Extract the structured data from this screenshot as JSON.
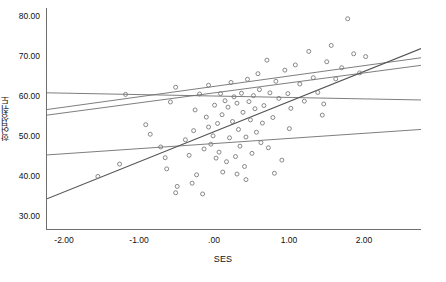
{
  "chart_data": {
    "type": "scatter",
    "title": "",
    "xlabel": "SES",
    "ylabel": "학업성취도",
    "xlim": [
      -2.6,
      2.4
    ],
    "ylim": [
      27.0,
      82.5
    ],
    "xticks": [
      -2,
      -1,
      0,
      1,
      2
    ],
    "xtick_labels": [
      "-2.00",
      "-1.00",
      ".00",
      "1.00",
      "2.00"
    ],
    "yticks": [
      30,
      40,
      50,
      60,
      70,
      80
    ],
    "ytick_labels": [
      "30.00",
      "40.00",
      "50.00",
      "60.00",
      "70.00",
      "80.00"
    ],
    "grid": false,
    "legend": "none",
    "marker": {
      "shape": "open-circle",
      "size": 4,
      "color": "#7a7a7a",
      "fill": "none"
    },
    "points": [
      [
        -1.92,
        40.2
      ],
      [
        -1.63,
        43.3
      ],
      [
        -1.55,
        60.8
      ],
      [
        -1.28,
        53.2
      ],
      [
        -1.22,
        50.8
      ],
      [
        -1.08,
        47.6
      ],
      [
        -1.02,
        44.9
      ],
      [
        -1.0,
        42.1
      ],
      [
        -0.88,
        62.6
      ],
      [
        -0.86,
        37.7
      ],
      [
        -0.88,
        36.1
      ],
      [
        -0.75,
        49.4
      ],
      [
        -0.7,
        45.5
      ],
      [
        -0.66,
        38.5
      ],
      [
        -0.62,
        56.9
      ],
      [
        -0.6,
        40.6
      ],
      [
        -0.56,
        60.9
      ],
      [
        -0.52,
        35.8
      ],
      [
        -0.5,
        47.1
      ],
      [
        -0.47,
        55.1
      ],
      [
        -0.44,
        52.6
      ],
      [
        -0.41,
        48.3
      ],
      [
        -0.38,
        50.4
      ],
      [
        -0.36,
        58.1
      ],
      [
        -0.34,
        44.8
      ],
      [
        -0.32,
        53.5
      ],
      [
        -0.3,
        46.3
      ],
      [
        -0.28,
        61.0
      ],
      [
        -0.26,
        55.7
      ],
      [
        -0.25,
        41.3
      ],
      [
        -0.22,
        59.2
      ],
      [
        -0.2,
        43.9
      ],
      [
        -0.18,
        57.6
      ],
      [
        -0.16,
        49.9
      ],
      [
        -0.14,
        63.8
      ],
      [
        -0.12,
        54.0
      ],
      [
        -0.1,
        60.2
      ],
      [
        -0.08,
        45.2
      ],
      [
        -0.06,
        58.6
      ],
      [
        -0.04,
        52.0
      ],
      [
        -0.02,
        47.8
      ],
      [
        0.0,
        61.1
      ],
      [
        0.02,
        56.3
      ],
      [
        0.04,
        42.7
      ],
      [
        0.06,
        50.1
      ],
      [
        0.08,
        64.6
      ],
      [
        0.1,
        59.0
      ],
      [
        0.12,
        54.4
      ],
      [
        0.14,
        46.0
      ],
      [
        0.16,
        60.5
      ],
      [
        0.18,
        57.2
      ],
      [
        0.2,
        51.3
      ],
      [
        0.22,
        66.0
      ],
      [
        0.24,
        62.0
      ],
      [
        0.26,
        48.7
      ],
      [
        0.3,
        58.0
      ],
      [
        0.34,
        69.4
      ],
      [
        0.38,
        61.2
      ],
      [
        0.42,
        55.0
      ],
      [
        0.46,
        64.1
      ],
      [
        0.5,
        59.8
      ],
      [
        0.54,
        44.3
      ],
      [
        0.58,
        66.9
      ],
      [
        0.62,
        61.0
      ],
      [
        0.66,
        57.3
      ],
      [
        0.72,
        68.2
      ],
      [
        0.78,
        63.4
      ],
      [
        0.84,
        59.1
      ],
      [
        0.9,
        71.6
      ],
      [
        0.96,
        65.0
      ],
      [
        1.02,
        61.3
      ],
      [
        1.08,
        55.6
      ],
      [
        1.14,
        69.0
      ],
      [
        1.2,
        73.1
      ],
      [
        1.26,
        64.7
      ],
      [
        1.34,
        67.5
      ],
      [
        1.42,
        79.8
      ],
      [
        1.5,
        71.0
      ],
      [
        1.58,
        66.2
      ],
      [
        1.66,
        70.3
      ],
      [
        0.28,
        53.6
      ],
      [
        0.36,
        47.4
      ],
      [
        -0.64,
        51.7
      ],
      [
        -0.95,
        58.9
      ],
      [
        0.64,
        52.2
      ],
      [
        1.1,
        58.4
      ],
      [
        -0.06,
        40.8
      ],
      [
        0.06,
        39.4
      ],
      [
        0.44,
        41.0
      ],
      [
        -0.44,
        63.1
      ]
    ],
    "regression_lines": [
      {
        "name": "line-1-flat-high",
        "x0": -2.6,
        "y0": 61.2,
        "x1": 2.4,
        "y1": 59.4,
        "color": "#6f6f6f",
        "width": 0.9
      },
      {
        "name": "line-2-moderate",
        "x0": -2.6,
        "y0": 57.0,
        "x1": 2.4,
        "y1": 70.0,
        "color": "#6f6f6f",
        "width": 0.9
      },
      {
        "name": "line-3-moderate-lower",
        "x0": -2.6,
        "y0": 55.6,
        "x1": 2.4,
        "y1": 68.1,
        "color": "#6f6f6f",
        "width": 0.9
      },
      {
        "name": "line-4-shallow",
        "x0": -2.6,
        "y0": 45.6,
        "x1": 2.4,
        "y1": 52.0,
        "color": "#6f6f6f",
        "width": 0.9
      },
      {
        "name": "line-5-steep",
        "x0": -2.6,
        "y0": 34.6,
        "x1": 2.4,
        "y1": 72.3,
        "color": "#555555",
        "width": 1.1
      }
    ]
  },
  "axis": {
    "y_title": "학업성취도",
    "x_title": "SES",
    "x_tick_labels": [
      "-2.00",
      "-1.00",
      ".00",
      "1.00",
      "2.00"
    ],
    "y_tick_labels": [
      "80.00",
      "70.00",
      "60.00",
      "50.00",
      "40.00",
      "30.00"
    ]
  }
}
